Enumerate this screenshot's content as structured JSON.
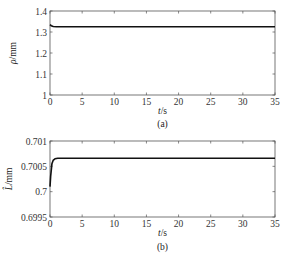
{
  "chart_data": [
    {
      "type": "line",
      "panel_label": "(a)",
      "xlabel": "t/s",
      "ylabel": "ρ/mm",
      "xlim": [
        0,
        35
      ],
      "ylim": [
        1,
        1.4
      ],
      "xticks": [
        "0",
        "5",
        "10",
        "15",
        "20",
        "25",
        "30",
        "35"
      ],
      "yticks": [
        "1",
        "1.1",
        "1.2",
        "1.3",
        "1.4"
      ],
      "grid": false,
      "series": [
        {
          "name": "rho",
          "x": [
            0,
            0.2,
            0.5,
            1,
            35
          ],
          "values": [
            1.335,
            1.33,
            1.326,
            1.325,
            1.325
          ]
        }
      ]
    },
    {
      "type": "line",
      "panel_label": "(b)",
      "xlabel": "t/s",
      "ylabel": "L̂/mm",
      "xlim": [
        0,
        35
      ],
      "ylim": [
        0.6995,
        0.701
      ],
      "xticks": [
        "0",
        "5",
        "10",
        "15",
        "20",
        "25",
        "30",
        "35"
      ],
      "yticks": [
        "0.6995",
        "0.7",
        "0.7005",
        "0.701"
      ],
      "grid": false,
      "series": [
        {
          "name": "L_hat",
          "x": [
            0,
            0.1,
            0.3,
            0.5,
            0.8,
            1.2,
            35
          ],
          "values": [
            0.7001,
            0.7003,
            0.70055,
            0.70062,
            0.70065,
            0.70066,
            0.70066
          ]
        }
      ]
    }
  ]
}
